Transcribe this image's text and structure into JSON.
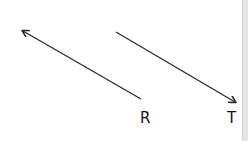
{
  "diagram": {
    "vectors": [
      {
        "name": "R",
        "label": "R",
        "from": [
          141,
          99
        ],
        "to": [
          23,
          31
        ],
        "label_pos": [
          140,
          111
        ]
      },
      {
        "name": "T",
        "label": "T",
        "from": [
          116,
          32
        ],
        "to": [
          235,
          102
        ],
        "label_pos": [
          227,
          111
        ]
      }
    ],
    "colors": {
      "stroke": "#2a2a2a",
      "background": "#ffffff"
    }
  }
}
